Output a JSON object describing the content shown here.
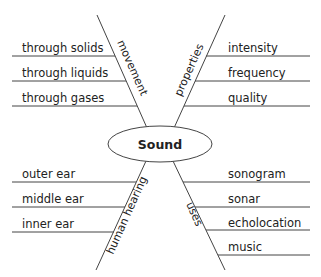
{
  "diagram": {
    "type": "spider-map",
    "center": {
      "label": "Sound"
    },
    "branches": [
      {
        "label": "movement",
        "position": "upper-left",
        "items": [
          "through solids",
          "through liquids",
          "through gases"
        ]
      },
      {
        "label": "properties",
        "position": "upper-right",
        "items": [
          "intensity",
          "frequency",
          "quality"
        ]
      },
      {
        "label": "human hearing",
        "position": "lower-left",
        "items": [
          "outer ear",
          "middle ear",
          "inner ear"
        ]
      },
      {
        "label": "uses",
        "position": "lower-right",
        "items": [
          "sonogram",
          "sonar",
          "echolocation",
          "music"
        ]
      }
    ],
    "colors": {
      "line": "#444444",
      "text": "#222222",
      "background": "#ffffff"
    }
  }
}
